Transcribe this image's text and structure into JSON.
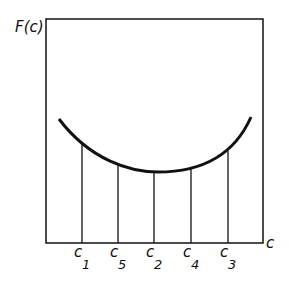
{
  "diagram": {
    "y_axis_label": "F(c)",
    "x_axis_label": "c",
    "points": [
      {
        "name": "c",
        "sub": "1",
        "x": 82,
        "y_curve": 143
      },
      {
        "name": "c",
        "sub": "5",
        "x": 118,
        "y_curve": 164
      },
      {
        "name": "c",
        "sub": "2",
        "x": 154,
        "y_curve": 172
      },
      {
        "name": "c",
        "sub": "4",
        "x": 191,
        "y_curve": 169
      },
      {
        "name": "c",
        "sub": "3",
        "x": 228,
        "y_curve": 151
      }
    ]
  },
  "colors": {
    "line": "#111111",
    "background": "#ffffff"
  }
}
